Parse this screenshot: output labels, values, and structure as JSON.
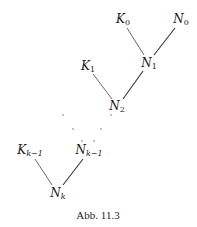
{
  "nodes": {
    "K0": {
      "base": "K",
      "sub": "0"
    },
    "N0": {
      "base": "N",
      "sub": "0"
    },
    "N1": {
      "base": "N",
      "sub": "1"
    },
    "K1": {
      "base": "K",
      "sub": "1"
    },
    "N2": {
      "base": "N",
      "sub": "2"
    },
    "Kk1": {
      "base": "K",
      "sub": "k−1"
    },
    "Nk1": {
      "base": "N",
      "sub": "k−1"
    },
    "Nk": {
      "base": "N",
      "sub": "k"
    }
  },
  "edges": [
    [
      "K0",
      "N1"
    ],
    [
      "N0",
      "N1"
    ],
    [
      "K1",
      "N2"
    ],
    [
      "N1",
      "N2"
    ],
    [
      "Kk1",
      "Nk"
    ],
    [
      "Nk1",
      "Nk"
    ]
  ],
  "ellipsis": "· · ·",
  "caption": "Abb. 11.3",
  "colors": {
    "ink": "#1a1a1a",
    "line": "#333333"
  }
}
